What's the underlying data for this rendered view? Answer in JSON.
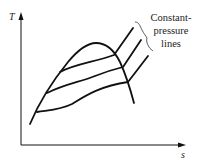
{
  "diagram": {
    "type": "T-s diagram",
    "y_axis_label": "T",
    "x_axis_label": "s",
    "annotation": {
      "lines": [
        "Constant-",
        "pressure",
        "lines"
      ]
    },
    "colors": {
      "stroke": "#111111",
      "text": "#222222",
      "background": "#ffffff"
    },
    "curves": {
      "saturation_dome": "bell-shaped vapor dome",
      "constant_pressure_lines": 3
    }
  }
}
